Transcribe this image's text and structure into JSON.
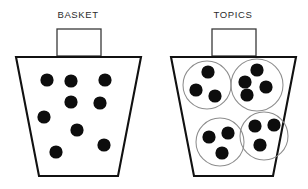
{
  "canvas": {
    "width": 308,
    "height": 189,
    "background": "#ffffff"
  },
  "colors": {
    "dot": "#0d0d0d",
    "basket_outline": "#111111",
    "handle_outline": "#3a3a3a",
    "topic_circle_outline": "#8d8d8d",
    "title_text": "#2b2b2b",
    "background": "#ffffff"
  },
  "panels": [
    {
      "id": "basket-panel",
      "title": "BASKET",
      "title_x": 78,
      "title_y": 15,
      "handle": {
        "x": 57,
        "y": 29,
        "width": 44,
        "height": 27
      },
      "basket": {
        "top_left_x": 16,
        "top_right_x": 141,
        "top_y": 57,
        "bottom_left_x": 39,
        "bottom_right_x": 118,
        "bottom_y": 176
      },
      "dot_radius": 6.6,
      "dots": [
        {
          "cx": 47,
          "cy": 80
        },
        {
          "cx": 71,
          "cy": 81
        },
        {
          "cx": 105,
          "cy": 80
        },
        {
          "cx": 71,
          "cy": 102
        },
        {
          "cx": 100,
          "cy": 103
        },
        {
          "cx": 44,
          "cy": 117
        },
        {
          "cx": 77,
          "cy": 130
        },
        {
          "cx": 104,
          "cy": 145
        },
        {
          "cx": 56,
          "cy": 152
        }
      ],
      "topic_circles": []
    },
    {
      "id": "topics-panel",
      "title": "TOPICS",
      "title_x": 233,
      "title_y": 15,
      "handle": {
        "x": 212,
        "y": 29,
        "width": 44,
        "height": 27
      },
      "basket": {
        "top_left_x": 171,
        "top_right_x": 296,
        "top_y": 57,
        "bottom_left_x": 194,
        "bottom_right_x": 273,
        "bottom_y": 176
      },
      "dot_radius": 6.6,
      "topic_circles": [
        {
          "name": "topic-group-1",
          "cx": 207,
          "cy": 85,
          "r": 24,
          "dots": [
            {
              "cx": 208,
              "cy": 72
            },
            {
              "cx": 196,
              "cy": 90
            },
            {
              "cx": 215,
              "cy": 96
            }
          ]
        },
        {
          "name": "topic-group-2",
          "cx": 257,
          "cy": 85,
          "r": 26,
          "dots": [
            {
              "cx": 257,
              "cy": 70
            },
            {
              "cx": 245,
              "cy": 82
            },
            {
              "cx": 266,
              "cy": 87
            },
            {
              "cx": 247,
              "cy": 95
            }
          ]
        },
        {
          "name": "topic-group-3",
          "cx": 220,
          "cy": 142,
          "r": 24,
          "dots": [
            {
              "cx": 209,
              "cy": 137
            },
            {
              "cx": 228,
              "cy": 133
            },
            {
              "cx": 222,
              "cy": 153
            }
          ]
        },
        {
          "name": "topic-group-4",
          "cx": 264,
          "cy": 136,
          "r": 24,
          "dots": [
            {
              "cx": 255,
              "cy": 126
            },
            {
              "cx": 274,
              "cy": 125
            },
            {
              "cx": 260,
              "cy": 145
            }
          ]
        }
      ],
      "dots": []
    }
  ]
}
